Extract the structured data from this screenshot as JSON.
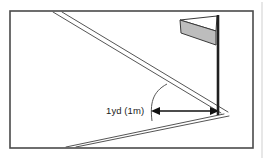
{
  "figure": {
    "name": "golf-flagstick-distance-diagram",
    "background_color": "#ffffff",
    "frame": {
      "name": "diagram-border",
      "stroke_color": "#4a4a4a",
      "stroke_width": 1.6,
      "x": 10,
      "y": 11,
      "width": 243,
      "height": 137,
      "fill": "#ffffff"
    },
    "page_edge": {
      "name": "page-edge-line",
      "stroke_color": "#cfcfcf",
      "x": 262,
      "y1": 2,
      "y2": 158
    },
    "annotation": {
      "name": "distance-label",
      "text": "1yd (1m)",
      "x": 106,
      "y": 112,
      "font_size": 9.5,
      "color": "#1a1a1a"
    },
    "arrow": {
      "name": "double-headed-distance-arrow",
      "stroke_color": "#111111",
      "stroke_width": 1.5,
      "x1": 154,
      "y1": 111,
      "x2": 216,
      "y2": 111,
      "head_size": 6
    },
    "flag": {
      "name": "golf-flag",
      "pole": {
        "name": "flag-pole",
        "x": 218,
        "y_top": 15,
        "y_bottom": 115,
        "color": "#202020",
        "width": 2.6
      },
      "upper_panel": {
        "name": "flag-upper-panel",
        "fill": "#ffffff",
        "stroke": "#3a3a3a",
        "points": "218,16 180,20 217,31"
      },
      "lower_panel": {
        "name": "flag-lower-panel",
        "fill": "#bdbdbd",
        "stroke": "#3a3a3a",
        "points": "217,31 180,20 181,32 217,45"
      }
    },
    "guide_lines": {
      "name": "perspective-guide-lines",
      "stroke_color": "#555555",
      "stroke_width": 1.0,
      "upper_pair": [
        {
          "name": "upper-guide-line-a",
          "x1": 53,
          "y1": 12,
          "x2": 221,
          "y2": 113
        },
        {
          "name": "upper-guide-line-b",
          "x1": 62,
          "y1": 12,
          "x2": 228,
          "y2": 112
        }
      ],
      "lower_pair": [
        {
          "name": "lower-guide-line-a",
          "x1": 66,
          "y1": 147,
          "x2": 224,
          "y2": 114
        },
        {
          "name": "lower-guide-line-b",
          "x1": 76,
          "y1": 147,
          "x2": 229,
          "y2": 116
        }
      ]
    },
    "arc": {
      "name": "angle-arc",
      "stroke_color": "#555555",
      "stroke_width": 1.0,
      "path": "M 167,84 C 152,92 150,104 152,120"
    },
    "colors": {
      "ink": "#1a1a1a",
      "frame": "#4a4a4a",
      "line": "#555555",
      "flag_gray": "#bdbdbd",
      "pole": "#202020",
      "paper": "#ffffff"
    }
  }
}
